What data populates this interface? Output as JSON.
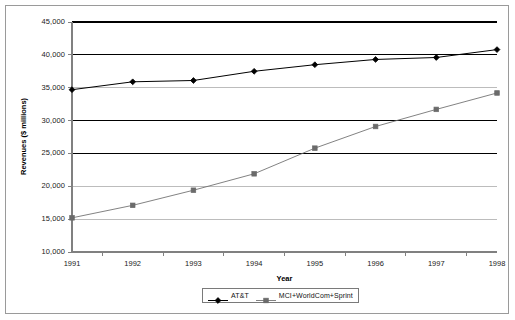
{
  "chart_data": {
    "type": "line",
    "title": "",
    "subtitle": "",
    "xlabel": "Year",
    "ylabel": "Revenues ($ millions)",
    "categories": [
      "1991",
      "1992",
      "1993",
      "1994",
      "1995",
      "1996",
      "1997",
      "1998"
    ],
    "x": [
      1991,
      1992,
      1993,
      1994,
      1995,
      1996,
      1997,
      1998
    ],
    "xlim": [
      1990.5,
      1998.5
    ],
    "ylim": [
      10000,
      45000
    ],
    "ytick_values": [
      10000,
      15000,
      20000,
      25000,
      30000,
      35000,
      40000,
      45000
    ],
    "ytick_labels": [
      "10,000",
      "15,000",
      "20,000",
      "25,000",
      "30,000",
      "35,000",
      "40,000",
      "45,000"
    ],
    "grid": true,
    "grid_orientation": "horizontal",
    "legend_position": "bottom-center",
    "series": [
      {
        "name": "AT&T",
        "marker": "filled-diamond",
        "color": "#000000",
        "values": [
          34700,
          35900,
          36100,
          37500,
          38500,
          39300,
          39600,
          40800
        ]
      },
      {
        "name": "MCI+WorldCom+Sprint",
        "marker": "filled-square",
        "color": "#6b6b6b",
        "values": [
          15200,
          17100,
          19400,
          21900,
          25800,
          29100,
          31700,
          34200
        ]
      }
    ]
  },
  "legend": {
    "entries": [
      {
        "label": "AT&T"
      },
      {
        "label": "MCI+WorldCom+Sprint"
      }
    ]
  },
  "colors": {
    "series_1": "#000000",
    "series_2": "#6b6b6b",
    "grid_major": "#000000",
    "grid_minor": "#b5b5b5",
    "axis": "#808080",
    "frame": "#9a9a9a",
    "background": "#ffffff"
  }
}
